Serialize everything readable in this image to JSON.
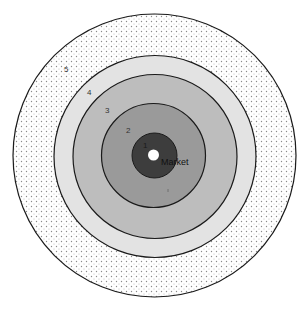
{
  "diagram": {
    "type": "concentric-rings",
    "center_label": "Market",
    "rings": [
      {
        "label": "1",
        "fill": "#3d3d3d",
        "pattern": "solid"
      },
      {
        "label": "2",
        "fill": "#9a9a9a",
        "pattern": "solid"
      },
      {
        "label": "3",
        "fill": "#bdbdbd",
        "pattern": "solid"
      },
      {
        "label": "4",
        "fill": "#e3e3e3",
        "pattern": "solid"
      },
      {
        "label": "5",
        "fill": "#ffffff",
        "pattern": "dotted"
      }
    ],
    "center_dot_fill": "#ffffff",
    "stroke_color": "#1a1a1a"
  }
}
